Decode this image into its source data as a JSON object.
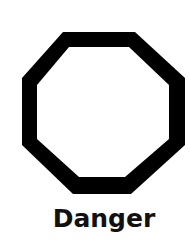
{
  "sign": {
    "shape": "octagon",
    "icon": "octagon-outline-icon",
    "stroke_color": "#000000",
    "fill_color": "#ffffff",
    "label": "Danger"
  }
}
